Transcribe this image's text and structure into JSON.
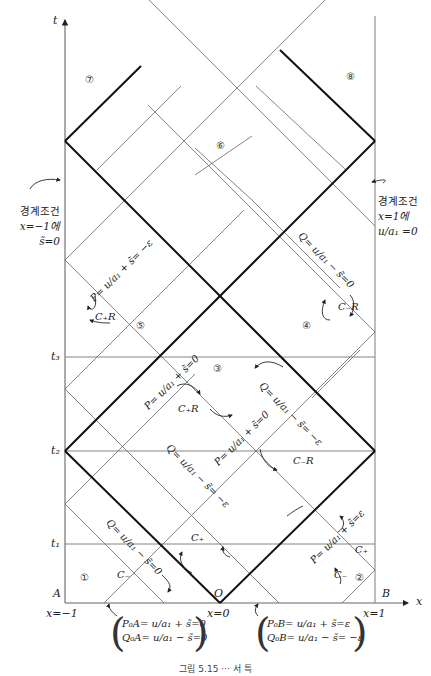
{
  "axes": {
    "t_label": "t",
    "x_label": "x",
    "corner_A": "A",
    "corner_B": "B",
    "origin_label": "O",
    "x_ticks": [
      "x=−1",
      "x=0",
      "x=1"
    ],
    "t_ticks": [
      "t₁",
      "t₂",
      "t₃"
    ]
  },
  "regions": [
    "①",
    "②",
    "③",
    "④",
    "⑤",
    "⑥",
    "⑦",
    "⑧"
  ],
  "boundary_left": {
    "title": "경계조건",
    "line1": "x=−1에",
    "line2": "s̃=0"
  },
  "boundary_right": {
    "title": "경계조건",
    "line1": "x=1에",
    "line2": "u/a₁ =0"
  },
  "invariants": {
    "q_region1": "Q= u/a₁ − s̃=0",
    "p_region2": "P= u/a₁ + s̃=ε",
    "q_mid_lower": "Q= u/a₁ − s̃= −ε",
    "p_mid_lower": "P= u/a₁ + s̃=0",
    "p_upper_left": "P= u/a₁ + s̃=0",
    "q_upper_right": "Q= u/a₁ − s̃= −ε",
    "p_region5": "P= u/a₁ + s̃= −ε",
    "q_region4": "Q= u/a₁ − s̃=0"
  },
  "characteristics": {
    "c_plus_1": "C₊",
    "c_minus_1": "C₋",
    "c_plus_2": "C₊",
    "c_minus_2": "C₋",
    "c_plus_R_mid": "C₊R",
    "c_minus_R_mid": "C₋R",
    "c_plus_R_5": "C₊R",
    "c_minus_R_4": "C₋R"
  },
  "initial_conditions": {
    "left": {
      "P": "P₀A= u/a₁ + s̃=0",
      "Q": "Q₀A= u/a₁ − s̃=0"
    },
    "right": {
      "P": "P₀B= u/a₁ + s̃=ε",
      "Q": "Q₀B= u/a₁ − s̃= −ε"
    }
  },
  "caption": "그림 5.15 ··· 서 특"
}
